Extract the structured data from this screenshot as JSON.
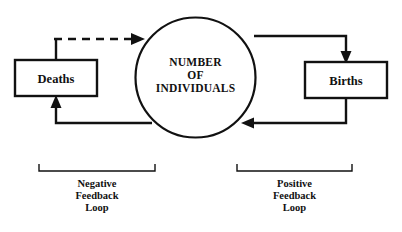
{
  "diagram": {
    "colors": {
      "stroke": "#111111",
      "background": "#ffffff"
    },
    "nodes": [
      {
        "id": "deaths",
        "label": "Deaths",
        "shape": "rectangle"
      },
      {
        "id": "population",
        "shape": "circle",
        "label_lines": [
          "NUMBER",
          "OF",
          "INDIVIDUALS"
        ],
        "line1": "NUMBER",
        "line2": "OF",
        "line3": "INDIVIDUALS"
      },
      {
        "id": "births",
        "label": "Births",
        "shape": "rectangle"
      }
    ],
    "connectors": [
      {
        "id": "deaths-to-population",
        "style": "dashed",
        "from": "deaths",
        "to": "population"
      },
      {
        "id": "population-to-deaths",
        "style": "solid",
        "from": "population",
        "to": "deaths"
      },
      {
        "id": "population-to-births",
        "style": "solid",
        "from": "population",
        "to": "births"
      },
      {
        "id": "births-to-population",
        "style": "solid",
        "from": "births",
        "to": "population"
      }
    ],
    "brackets": [
      {
        "id": "negative-loop",
        "line1": "Negative",
        "line2": "Feedback",
        "line3": "Loop"
      },
      {
        "id": "positive-loop",
        "line1": "Positive",
        "line2": "Feedback",
        "line3": "Loop"
      }
    ]
  }
}
